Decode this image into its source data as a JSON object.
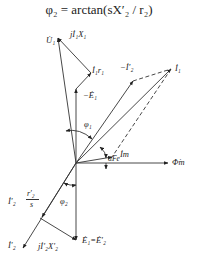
{
  "formula": "φ₂ = arctan(sX′₂ / r₂)",
  "labels": {
    "U1": "U̇₁",
    "jI1X1": "jİ₁X₁",
    "I1r1": "İ₁r₁",
    "minus_I2p": "−İ′₂",
    "I1": "İ₁",
    "minus_E1": "−Ė₁",
    "phi1": "φ₁",
    "Im": "İm",
    "alpha_Fe": "αFe",
    "Phi_m": "Φ̇m",
    "I2p_r2p_s_current": "İ′₂",
    "r2p": "r′₂",
    "s": "s",
    "phi2": "φ₂",
    "I2p": "İ′₂",
    "jI2pX2p": "jİ′₂X′₂",
    "E1_eq_E2p": "Ė₁=Ė′₂"
  },
  "colors": {
    "line": "#333333",
    "background": "#ffffff"
  }
}
